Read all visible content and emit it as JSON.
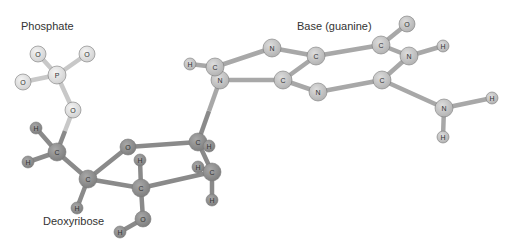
{
  "labels": {
    "phosphate": {
      "text": "Phosphate",
      "x": 21,
      "y": 26
    },
    "base": {
      "text": "Base (guanine)",
      "x": 297,
      "y": 26
    },
    "sugar": {
      "text": "Deoxyribose",
      "x": 43,
      "y": 221
    }
  },
  "colors": {
    "phosphate_atom": "#dcdcdc",
    "phosphate_bond": "#c8c8c8",
    "sugar_atom": "#8f8f8f",
    "sugar_bond": "#8a8a8a",
    "base_atom": "#c4c4c4",
    "base_bond": "#a8a8a8",
    "atom_stroke": "#7a7a7a",
    "text": "#333333"
  },
  "atoms": [
    {
      "id": "P",
      "el": "P",
      "x": 57,
      "y": 75,
      "r": 9,
      "group": "phosphate"
    },
    {
      "id": "O1",
      "el": "O",
      "x": 38,
      "y": 54,
      "r": 8,
      "group": "phosphate"
    },
    {
      "id": "O2",
      "el": "O",
      "x": 87,
      "y": 54,
      "r": 8,
      "group": "phosphate"
    },
    {
      "id": "O3",
      "el": "O",
      "x": 23,
      "y": 82,
      "r": 8,
      "group": "phosphate"
    },
    {
      "id": "O5",
      "el": "O",
      "x": 73,
      "y": 110,
      "r": 8,
      "group": "phosphate"
    },
    {
      "id": "C5",
      "el": "C",
      "x": 57,
      "y": 152,
      "r": 9,
      "group": "sugar"
    },
    {
      "id": "H5a",
      "el": "H",
      "x": 36,
      "y": 128,
      "r": 6,
      "group": "sugar"
    },
    {
      "id": "H5b",
      "el": "H",
      "x": 28,
      "y": 162,
      "r": 6,
      "group": "sugar"
    },
    {
      "id": "C4",
      "el": "C",
      "x": 88,
      "y": 179,
      "r": 9,
      "group": "sugar"
    },
    {
      "id": "H4",
      "el": "H",
      "x": 77,
      "y": 208,
      "r": 6,
      "group": "sugar"
    },
    {
      "id": "Or",
      "el": "O",
      "x": 128,
      "y": 147,
      "r": 8,
      "group": "sugar"
    },
    {
      "id": "C3",
      "el": "C",
      "x": 141,
      "y": 188,
      "r": 9,
      "group": "sugar"
    },
    {
      "id": "H3",
      "el": "H",
      "x": 140,
      "y": 160,
      "r": 6,
      "group": "sugar"
    },
    {
      "id": "O3s",
      "el": "O",
      "x": 143,
      "y": 219,
      "r": 8,
      "group": "sugar"
    },
    {
      "id": "HO3",
      "el": "H",
      "x": 120,
      "y": 232,
      "r": 6,
      "group": "sugar"
    },
    {
      "id": "C1",
      "el": "C",
      "x": 198,
      "y": 142,
      "r": 9,
      "group": "sugar"
    },
    {
      "id": "H1",
      "el": "H",
      "x": 209,
      "y": 146,
      "r": 6,
      "group": "sugar"
    },
    {
      "id": "C2",
      "el": "C",
      "x": 212,
      "y": 172,
      "r": 9,
      "group": "sugar"
    },
    {
      "id": "H2a",
      "el": "H",
      "x": 198,
      "y": 167,
      "r": 6,
      "group": "sugar"
    },
    {
      "id": "H2b",
      "el": "H",
      "x": 212,
      "y": 200,
      "r": 6,
      "group": "sugar"
    },
    {
      "id": "N9",
      "el": "N",
      "x": 220,
      "y": 80,
      "r": 9,
      "group": "base"
    },
    {
      "id": "C8",
      "el": "C",
      "x": 215,
      "y": 67,
      "r": 9,
      "group": "base"
    },
    {
      "id": "H8",
      "el": "H",
      "x": 190,
      "y": 64,
      "r": 6,
      "group": "base"
    },
    {
      "id": "N7",
      "el": "N",
      "x": 272,
      "y": 48,
      "r": 9,
      "group": "base"
    },
    {
      "id": "C4b",
      "el": "C",
      "x": 283,
      "y": 80,
      "r": 9,
      "group": "base"
    },
    {
      "id": "C5b",
      "el": "C",
      "x": 316,
      "y": 56,
      "r": 9,
      "group": "base"
    },
    {
      "id": "N3",
      "el": "N",
      "x": 318,
      "y": 92,
      "r": 9,
      "group": "base"
    },
    {
      "id": "C6",
      "el": "C",
      "x": 381,
      "y": 45,
      "r": 9,
      "group": "base"
    },
    {
      "id": "O6",
      "el": "O",
      "x": 407,
      "y": 24,
      "r": 8,
      "group": "base"
    },
    {
      "id": "N1",
      "el": "N",
      "x": 409,
      "y": 56,
      "r": 9,
      "group": "base"
    },
    {
      "id": "H1b",
      "el": "H",
      "x": 443,
      "y": 46,
      "r": 6,
      "group": "base"
    },
    {
      "id": "C2b",
      "el": "C",
      "x": 382,
      "y": 80,
      "r": 9,
      "group": "base"
    },
    {
      "id": "N2",
      "el": "N",
      "x": 444,
      "y": 108,
      "r": 9,
      "group": "base"
    },
    {
      "id": "H2c",
      "el": "H",
      "x": 492,
      "y": 98,
      "r": 6,
      "group": "base"
    },
    {
      "id": "H2d",
      "el": "H",
      "x": 443,
      "y": 137,
      "r": 6,
      "group": "base"
    }
  ],
  "bonds": [
    [
      "P",
      "O1",
      "phosphate"
    ],
    [
      "P",
      "O2",
      "phosphate"
    ],
    [
      "P",
      "O3",
      "phosphate"
    ],
    [
      "P",
      "O5",
      "phosphate"
    ],
    [
      "O5",
      "C5",
      "mixed"
    ],
    [
      "C5",
      "H5a",
      "sugar"
    ],
    [
      "C5",
      "H5b",
      "sugar"
    ],
    [
      "C5",
      "C4",
      "sugar"
    ],
    [
      "C4",
      "H4",
      "sugar"
    ],
    [
      "C4",
      "Or",
      "sugar"
    ],
    [
      "C4",
      "C3",
      "sugar"
    ],
    [
      "Or",
      "C1",
      "sugar"
    ],
    [
      "C3",
      "H3",
      "sugar"
    ],
    [
      "C3",
      "O3s",
      "sugar"
    ],
    [
      "O3s",
      "HO3",
      "sugar"
    ],
    [
      "C3",
      "C2",
      "sugar"
    ],
    [
      "C1",
      "C2",
      "sugar"
    ],
    [
      "C1",
      "H1",
      "sugar"
    ],
    [
      "C2",
      "H2a",
      "sugar"
    ],
    [
      "C2",
      "H2b",
      "sugar"
    ],
    [
      "C1",
      "N9",
      "mixed"
    ],
    [
      "N9",
      "C8",
      "base"
    ],
    [
      "C8",
      "H8",
      "base"
    ],
    [
      "C8",
      "N7",
      "base"
    ],
    [
      "N7",
      "C5b",
      "base"
    ],
    [
      "N9",
      "C4b",
      "base"
    ],
    [
      "C4b",
      "C5b",
      "base"
    ],
    [
      "C4b",
      "N3",
      "base"
    ],
    [
      "N3",
      "C2b",
      "base"
    ],
    [
      "C5b",
      "C6",
      "base"
    ],
    [
      "C6",
      "O6",
      "base"
    ],
    [
      "C6",
      "N1",
      "base"
    ],
    [
      "N1",
      "H1b",
      "base"
    ],
    [
      "N1",
      "C2b",
      "base"
    ],
    [
      "C2b",
      "N2",
      "base"
    ],
    [
      "N2",
      "H2c",
      "base"
    ],
    [
      "N2",
      "H2d",
      "base"
    ]
  ]
}
